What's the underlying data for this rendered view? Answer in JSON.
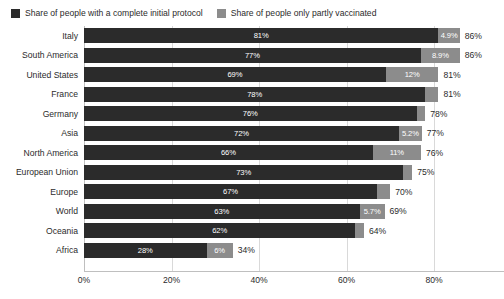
{
  "legend": {
    "entries": [
      {
        "label": "Share of people with a complete initial protocol",
        "color": "#2b2b2b",
        "key": "complete"
      },
      {
        "label": "Share of people only partly vaccinated",
        "color": "#8c8c8c",
        "key": "partial"
      }
    ]
  },
  "axis": {
    "ticks": [
      "0%",
      "20%",
      "40%",
      "60%",
      "80%"
    ],
    "tick_values": [
      0,
      20,
      40,
      60,
      80
    ],
    "max": 96
  },
  "chart_data": {
    "type": "bar",
    "orientation": "horizontal",
    "stacked": true,
    "title": "",
    "subtitle": "",
    "xlabel": "",
    "ylabel": "",
    "xlim": [
      0,
      96
    ],
    "grid": true,
    "legend_position": "top-left",
    "categories": [
      "Italy",
      "South America",
      "United States",
      "France",
      "Germany",
      "Asia",
      "North America",
      "European Union",
      "Europe",
      "World",
      "Oceania",
      "Africa"
    ],
    "series": [
      {
        "name": "Share of people with a complete initial protocol",
        "color": "#2b2b2b",
        "values": [
          81,
          77,
          69,
          78,
          76,
          72,
          66,
          73,
          67,
          63,
          62,
          28
        ],
        "labels": [
          "81%",
          "77%",
          "69%",
          "78%",
          "76%",
          "72%",
          "66%",
          "73%",
          "67%",
          "63%",
          "62%",
          "28%"
        ]
      },
      {
        "name": "Share of people only partly vaccinated",
        "color": "#8c8c8c",
        "values": [
          4.9,
          8.9,
          12,
          3,
          2,
          5.2,
          11,
          2,
          3,
          5.7,
          2,
          6
        ],
        "labels": [
          "4.9%",
          "8.9%",
          "12%",
          "",
          "",
          "5.2%",
          "11%",
          "",
          "",
          "5.7%",
          "",
          "6%"
        ]
      }
    ],
    "totals": [
      86,
      86,
      81,
      81,
      78,
      77,
      76,
      75,
      70,
      69,
      64,
      34
    ],
    "total_labels": [
      "86%",
      "86%",
      "81%",
      "81%",
      "78%",
      "77%",
      "76%",
      "75%",
      "70%",
      "69%",
      "64%",
      "34%"
    ]
  },
  "colors": {
    "complete": "#2b2b2b",
    "partial": "#8c8c8c",
    "gridline": "#d9d9d9",
    "axis": "#bfbfbf",
    "background": "#ffffff",
    "text": "#2b2b2b",
    "inner_label": "#ffffff"
  }
}
